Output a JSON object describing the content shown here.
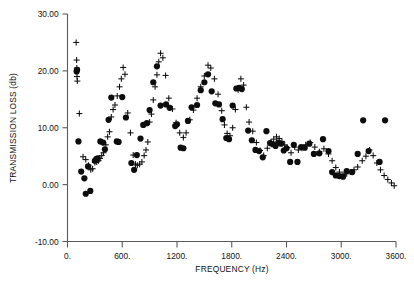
{
  "chart_data": {
    "type": "scatter",
    "title": "",
    "xlabel": "FREQUENCY (Hz)",
    "ylabel": "TRANSMISSION LOSS (db)",
    "xlim": [
      0,
      3600
    ],
    "ylim": [
      -10.0,
      30.0
    ],
    "xticks": [
      0,
      600,
      1200,
      1800,
      2400,
      3000,
      3600
    ],
    "xtick_labels": [
      "0.",
      "600.",
      "1200.",
      "1800.",
      "2400.",
      "3000.",
      "3600."
    ],
    "yticks": [
      -10.0,
      0.0,
      10.0,
      20.0,
      30.0
    ],
    "ytick_labels": [
      "-10.00",
      "0.00",
      "10.00",
      "20.00",
      "30.00"
    ],
    "grid": false,
    "legend": null,
    "series": [
      {
        "name": "measured",
        "marker": "filled-circle",
        "color": "#0d0d0d",
        "points": [
          [
            100,
            19.9
          ],
          [
            105,
            20.2
          ],
          [
            120,
            7.6
          ],
          [
            150,
            2.3
          ],
          [
            185,
            1.1
          ],
          [
            200,
            -1.6
          ],
          [
            225,
            3.2
          ],
          [
            250,
            -1.1
          ],
          [
            300,
            4.2
          ],
          [
            315,
            4.5
          ],
          [
            330,
            4.6
          ],
          [
            360,
            7.6
          ],
          [
            390,
            7.4
          ],
          [
            410,
            6.2
          ],
          [
            450,
            11.4
          ],
          [
            480,
            15.3
          ],
          [
            540,
            7.6
          ],
          [
            560,
            7.5
          ],
          [
            600,
            15.4
          ],
          [
            640,
            11.8
          ],
          [
            700,
            3.8
          ],
          [
            730,
            2.6
          ],
          [
            760,
            5.2
          ],
          [
            800,
            8.1
          ],
          [
            830,
            10.5
          ],
          [
            870,
            10.8
          ],
          [
            900,
            13.1
          ],
          [
            940,
            18.0
          ],
          [
            980,
            20.8
          ],
          [
            1020,
            13.9
          ],
          [
            1080,
            14.1
          ],
          [
            1120,
            13.5
          ],
          [
            1180,
            10.3
          ],
          [
            1200,
            10.6
          ],
          [
            1240,
            6.5
          ],
          [
            1270,
            6.4
          ],
          [
            1320,
            11.2
          ],
          [
            1360,
            13.6
          ],
          [
            1420,
            14.0
          ],
          [
            1460,
            16.6
          ],
          [
            1500,
            18.0
          ],
          [
            1540,
            19.4
          ],
          [
            1580,
            16.4
          ],
          [
            1620,
            14.3
          ],
          [
            1660,
            14.1
          ],
          [
            1700,
            11.5
          ],
          [
            1740,
            8.2
          ],
          [
            1770,
            8.0
          ],
          [
            1810,
            13.9
          ],
          [
            1850,
            16.9
          ],
          [
            1880,
            17.0
          ],
          [
            1910,
            16.8
          ],
          [
            1980,
            9.5
          ],
          [
            2020,
            7.8
          ],
          [
            2060,
            6.1
          ],
          [
            2100,
            5.9
          ],
          [
            2140,
            4.8
          ],
          [
            2180,
            9.4
          ],
          [
            2220,
            7.3
          ],
          [
            2250,
            7.1
          ],
          [
            2280,
            6.8
          ],
          [
            2310,
            7.4
          ],
          [
            2340,
            7.2
          ],
          [
            2370,
            6.0
          ],
          [
            2400,
            6.4
          ],
          [
            2440,
            4.0
          ],
          [
            2480,
            7.0
          ],
          [
            2520,
            4.0
          ],
          [
            2560,
            6.6
          ],
          [
            2600,
            6.5
          ],
          [
            2650,
            7.2
          ],
          [
            2700,
            5.4
          ],
          [
            2760,
            5.5
          ],
          [
            2800,
            8.0
          ],
          [
            2860,
            5.9
          ],
          [
            2900,
            2.2
          ],
          [
            2940,
            1.6
          ],
          [
            2980,
            1.5
          ],
          [
            3020,
            1.4
          ],
          [
            3060,
            2.4
          ],
          [
            3120,
            2.2
          ],
          [
            3180,
            5.4
          ],
          [
            3240,
            11.3
          ],
          [
            3300,
            5.9
          ],
          [
            3420,
            4.0
          ],
          [
            3480,
            11.3
          ]
        ]
      },
      {
        "name": "predicted",
        "marker": "plus",
        "color": "#0d0d0d",
        "points": [
          [
            95,
            25.0
          ],
          [
            100,
            21.9
          ],
          [
            102,
            20.5
          ],
          [
            104,
            19.0
          ],
          [
            108,
            18.2
          ],
          [
            130,
            12.5
          ],
          [
            170,
            4.9
          ],
          [
            200,
            4.4
          ],
          [
            230,
            3.4
          ],
          [
            255,
            2.6
          ],
          [
            275,
            2.8
          ],
          [
            300,
            3.9
          ],
          [
            320,
            4.0
          ],
          [
            340,
            4.2
          ],
          [
            355,
            4.6
          ],
          [
            375,
            5.1
          ],
          [
            395,
            5.6
          ],
          [
            420,
            7.0
          ],
          [
            440,
            8.4
          ],
          [
            460,
            9.3
          ],
          [
            480,
            11.9
          ],
          [
            500,
            13.2
          ],
          [
            520,
            14.0
          ],
          [
            545,
            15.6
          ],
          [
            570,
            17.2
          ],
          [
            590,
            18.6
          ],
          [
            610,
            20.6
          ],
          [
            630,
            19.4
          ],
          [
            660,
            12.6
          ],
          [
            690,
            9.1
          ],
          [
            720,
            5.2
          ],
          [
            745,
            3.6
          ],
          [
            765,
            3.4
          ],
          [
            790,
            3.6
          ],
          [
            815,
            4.0
          ],
          [
            840,
            5.1
          ],
          [
            860,
            6.1
          ],
          [
            880,
            7.5
          ],
          [
            900,
            11.0
          ],
          [
            920,
            12.4
          ],
          [
            940,
            14.9
          ],
          [
            960,
            17.2
          ],
          [
            980,
            19.3
          ],
          [
            1000,
            21.6
          ],
          [
            1020,
            23.1
          ],
          [
            1045,
            22.3
          ],
          [
            1075,
            19.2
          ],
          [
            1110,
            15.2
          ],
          [
            1150,
            13.3
          ],
          [
            1190,
            10.9
          ],
          [
            1230,
            9.1
          ],
          [
            1270,
            8.3
          ],
          [
            1300,
            9.1
          ],
          [
            1340,
            11.4
          ],
          [
            1380,
            13.1
          ],
          [
            1420,
            15.2
          ],
          [
            1460,
            17.2
          ],
          [
            1500,
            19.1
          ],
          [
            1540,
            21.0
          ],
          [
            1570,
            20.5
          ],
          [
            1610,
            18.6
          ],
          [
            1650,
            15.9
          ],
          [
            1690,
            13.0
          ],
          [
            1720,
            10.5
          ],
          [
            1750,
            9.0
          ],
          [
            1780,
            8.6
          ],
          [
            1810,
            10.0
          ],
          [
            1840,
            13.2
          ],
          [
            1870,
            16.7
          ],
          [
            1900,
            18.6
          ],
          [
            1930,
            17.5
          ],
          [
            1960,
            13.6
          ],
          [
            1990,
            11.0
          ],
          [
            2030,
            9.4
          ],
          [
            2070,
            7.4
          ],
          [
            2110,
            6.0
          ],
          [
            2150,
            5.1
          ],
          [
            2190,
            6.4
          ],
          [
            2230,
            7.5
          ],
          [
            2260,
            8.0
          ],
          [
            2290,
            8.4
          ],
          [
            2320,
            8.1
          ],
          [
            2350,
            7.6
          ],
          [
            2380,
            7.0
          ],
          [
            2410,
            6.5
          ],
          [
            2450,
            5.6
          ],
          [
            2490,
            6.6
          ],
          [
            2530,
            6.1
          ],
          [
            2570,
            6.4
          ],
          [
            2610,
            7.0
          ],
          [
            2660,
            7.4
          ],
          [
            2710,
            6.6
          ],
          [
            2760,
            5.8
          ],
          [
            2810,
            6.3
          ],
          [
            2860,
            5.4
          ],
          [
            2900,
            4.2
          ],
          [
            2940,
            3.0
          ],
          [
            2980,
            2.2
          ],
          [
            3020,
            1.8
          ],
          [
            3060,
            1.9
          ],
          [
            3100,
            2.2
          ],
          [
            3140,
            2.6
          ],
          [
            3180,
            3.1
          ],
          [
            3230,
            4.2
          ],
          [
            3270,
            5.0
          ],
          [
            3310,
            6.1
          ],
          [
            3350,
            5.1
          ],
          [
            3390,
            3.8
          ],
          [
            3430,
            2.6
          ],
          [
            3470,
            1.6
          ],
          [
            3510,
            0.9
          ],
          [
            3550,
            0.3
          ],
          [
            3580,
            -0.2
          ]
        ]
      }
    ]
  },
  "figure": {
    "axis_color": "#5a5a5a",
    "marker_color": "#0d0d0d",
    "background": "#ffffff"
  }
}
